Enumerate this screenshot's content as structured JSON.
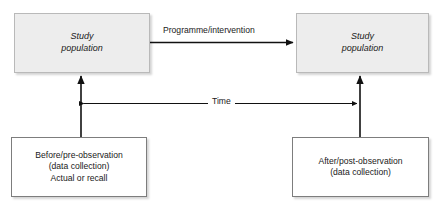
{
  "diagram": {
    "type": "flow-diagram",
    "background_color": "#ffffff",
    "text_color": "#1a1a1a",
    "shaded_fill": "#ededed",
    "shaded_border": "#b9b9b9",
    "plain_fill": "#ffffff",
    "plain_border": "#7d7d7d",
    "arrow_color": "#111111"
  },
  "nodes": {
    "top_left": {
      "id": "study-population-before",
      "style": "shaded",
      "lines": [
        "Study",
        "population"
      ]
    },
    "top_right": {
      "id": "study-population-after",
      "style": "shaded",
      "lines": [
        "Study",
        "population"
      ]
    },
    "bottom_left": {
      "id": "before-pre-observation",
      "style": "plain",
      "lines": [
        "Before/pre-observation",
        "(data collection)",
        "Actual or recall"
      ]
    },
    "bottom_right": {
      "id": "after-post-observation",
      "style": "plain",
      "lines": [
        "After/post-observation",
        "(data collection)"
      ]
    }
  },
  "edges": {
    "programme": {
      "label": "Programme/intervention",
      "from": "study-population-before",
      "to": "study-population-after",
      "direction": "right"
    },
    "time": {
      "label": "Time",
      "from": "before-pre-observation",
      "to": "after-post-observation",
      "direction": "both"
    },
    "observation_left": {
      "label": "",
      "from": "before-pre-observation",
      "to": "study-population-before",
      "direction": "up"
    },
    "observation_right": {
      "label": "",
      "from": "after-post-observation",
      "to": "study-population-after",
      "direction": "up"
    }
  }
}
